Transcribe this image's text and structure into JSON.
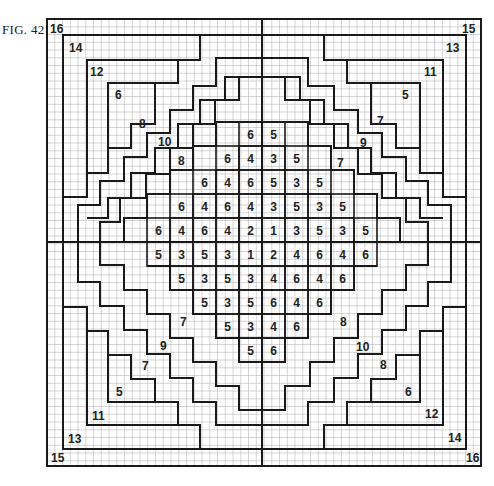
{
  "figure": {
    "label": "FIG. 42",
    "grid": {
      "x0": 47,
      "y0": 19,
      "x1": 481,
      "y1": 466,
      "cell": 7.75,
      "center_x": 262,
      "center_y": 242
    },
    "colors": {
      "line": "#1a1a1a",
      "fine_grid": "#b8b8b8",
      "background": "#ffffff"
    }
  },
  "center_block": {
    "col_x": [
      147,
      170,
      193,
      216,
      239,
      262,
      285,
      308,
      331,
      354,
      377
    ],
    "row_y": [
      122,
      146,
      170,
      194,
      218,
      242,
      266,
      290,
      314,
      338,
      362
    ],
    "rows": [
      {
        "start_col": 4,
        "values": [
          "6",
          "5"
        ]
      },
      {
        "start_col": 3,
        "values": [
          "6",
          "4",
          "3",
          "5"
        ]
      },
      {
        "start_col": 2,
        "values": [
          "6",
          "4",
          "6",
          "5",
          "3",
          "5"
        ]
      },
      {
        "start_col": 1,
        "values": [
          "6",
          "4",
          "6",
          "4",
          "3",
          "5",
          "3",
          "5"
        ]
      },
      {
        "start_col": 0,
        "values": [
          "6",
          "4",
          "6",
          "4",
          "2",
          "1",
          "3",
          "5",
          "3",
          "5"
        ]
      },
      {
        "start_col": 0,
        "values": [
          "5",
          "3",
          "5",
          "3",
          "1",
          "2",
          "4",
          "6",
          "4",
          "6"
        ]
      },
      {
        "start_col": 1,
        "values": [
          "5",
          "3",
          "5",
          "3",
          "4",
          "6",
          "4",
          "6"
        ]
      },
      {
        "start_col": 2,
        "values": [
          "5",
          "3",
          "5",
          "6",
          "4",
          "6"
        ]
      },
      {
        "start_col": 3,
        "values": [
          "5",
          "3",
          "4",
          "6"
        ]
      },
      {
        "start_col": 4,
        "values": [
          "5",
          "6"
        ]
      }
    ]
  },
  "region_labels": [
    {
      "text": "16",
      "x": 50,
      "y": 33
    },
    {
      "text": "14",
      "x": 69,
      "y": 52
    },
    {
      "text": "12",
      "x": 90,
      "y": 76
    },
    {
      "text": "6",
      "x": 115,
      "y": 99
    },
    {
      "text": "8",
      "x": 139,
      "y": 128
    },
    {
      "text": "10",
      "x": 158,
      "y": 146
    },
    {
      "text": "8",
      "x": 178,
      "y": 165
    },
    {
      "text": "15",
      "x": 462,
      "y": 33
    },
    {
      "text": "13",
      "x": 446,
      "y": 52
    },
    {
      "text": "11",
      "x": 424,
      "y": 76
    },
    {
      "text": "5",
      "x": 402,
      "y": 99
    },
    {
      "text": "7",
      "x": 377,
      "y": 125
    },
    {
      "text": "9",
      "x": 360,
      "y": 147
    },
    {
      "text": "7",
      "x": 337,
      "y": 167
    },
    {
      "text": "7",
      "x": 180,
      "y": 326
    },
    {
      "text": "9",
      "x": 160,
      "y": 350
    },
    {
      "text": "7",
      "x": 142,
      "y": 370
    },
    {
      "text": "5",
      "x": 116,
      "y": 396
    },
    {
      "text": "11",
      "x": 92,
      "y": 420
    },
    {
      "text": "13",
      "x": 68,
      "y": 443
    },
    {
      "text": "15",
      "x": 51,
      "y": 462
    },
    {
      "text": "8",
      "x": 340,
      "y": 326
    },
    {
      "text": "10",
      "x": 356,
      "y": 351
    },
    {
      "text": "8",
      "x": 380,
      "y": 369
    },
    {
      "text": "6",
      "x": 405,
      "y": 396
    },
    {
      "text": "12",
      "x": 425,
      "y": 418
    },
    {
      "text": "14",
      "x": 448,
      "y": 442
    },
    {
      "text": "16",
      "x": 466,
      "y": 462
    }
  ]
}
